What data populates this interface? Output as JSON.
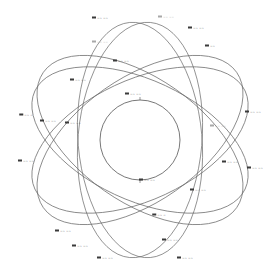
{
  "diagram": {
    "title": "",
    "colors": {
      "background": "#ffffff",
      "orbit_stroke": "#6a6a6a",
      "earth_stroke": "#555555",
      "label": "#333333",
      "label_faint": "#9a9a9a"
    },
    "center": {
      "x": 140,
      "y": 140,
      "radius": 40
    },
    "orbits": [
      {
        "id": "orbit-a",
        "rx": 118,
        "ry": 62,
        "rotate": 35
      },
      {
        "id": "orbit-b",
        "rx": 118,
        "ry": 62,
        "rotate": -35
      },
      {
        "id": "orbit-c",
        "rx": 118,
        "ry": 62,
        "rotate": 95
      },
      {
        "id": "orbit-d",
        "rx": 118,
        "ry": 62,
        "rotate": -95
      },
      {
        "id": "orbit-e",
        "rx": 116,
        "ry": 60,
        "rotate": 155
      },
      {
        "id": "orbit-f",
        "rx": 116,
        "ry": 60,
        "rotate": 25
      }
    ],
    "satellites": [
      {
        "id": "sat-1",
        "x": 100,
        "y": 18,
        "text": "~~ ~~",
        "faint": false
      },
      {
        "id": "sat-2",
        "x": 166,
        "y": 17,
        "text": "~~ ~~",
        "faint": true
      },
      {
        "id": "sat-3",
        "x": 196,
        "y": 28,
        "text": "~~ ~~",
        "faint": false
      },
      {
        "id": "sat-4",
        "x": 100,
        "y": 42,
        "text": "~~ ~~",
        "faint": true
      },
      {
        "id": "sat-5",
        "x": 121,
        "y": 61,
        "text": "~~ ~~",
        "faint": false
      },
      {
        "id": "sat-6",
        "x": 210,
        "y": 46,
        "text": "~~",
        "faint": false
      },
      {
        "id": "sat-7",
        "x": 78,
        "y": 80,
        "text": "~~ ~~",
        "faint": false
      },
      {
        "id": "sat-8",
        "x": 133,
        "y": 94,
        "text": "~~ ~~",
        "faint": false
      },
      {
        "id": "sat-9",
        "x": 26,
        "y": 115,
        "text": "~~ ~",
        "faint": false
      },
      {
        "id": "sat-10",
        "x": 48,
        "y": 121,
        "text": "~~ ~~",
        "faint": false
      },
      {
        "id": "sat-11",
        "x": 73,
        "y": 123,
        "text": "~~ ~~",
        "faint": false
      },
      {
        "id": "sat-12",
        "x": 253,
        "y": 112,
        "text": "~~ ~~",
        "faint": false
      },
      {
        "id": "sat-13",
        "x": 218,
        "y": 126,
        "text": "~~ ~~",
        "faint": true
      },
      {
        "id": "sat-14",
        "x": 26,
        "y": 161,
        "text": "~~ ~~",
        "faint": false
      },
      {
        "id": "sat-15",
        "x": 147,
        "y": 180,
        "text": "~~ ~~",
        "faint": false
      },
      {
        "id": "sat-16",
        "x": 230,
        "y": 162,
        "text": "~~ ~~",
        "faint": false
      },
      {
        "id": "sat-17",
        "x": 255,
        "y": 168,
        "text": "~~ ~~",
        "faint": false
      },
      {
        "id": "sat-18",
        "x": 198,
        "y": 190,
        "text": "~~ ~~",
        "faint": false
      },
      {
        "id": "sat-19",
        "x": 159,
        "y": 215,
        "text": "~~ ~",
        "faint": false
      },
      {
        "id": "sat-20",
        "x": 63,
        "y": 231,
        "text": "~~ ~~",
        "faint": false
      },
      {
        "id": "sat-21",
        "x": 80,
        "y": 246,
        "text": "~~ ~~",
        "faint": false
      },
      {
        "id": "sat-22",
        "x": 170,
        "y": 240,
        "text": "~~ ~~",
        "faint": false
      },
      {
        "id": "sat-23",
        "x": 105,
        "y": 258,
        "text": "~~ ~~",
        "faint": false
      },
      {
        "id": "sat-24",
        "x": 185,
        "y": 258,
        "text": "~~ ~~",
        "faint": false
      }
    ]
  }
}
